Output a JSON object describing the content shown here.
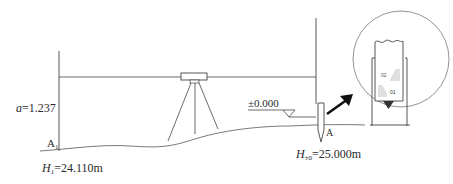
{
  "diagram": {
    "type": "leveling-setup",
    "colors": {
      "line": "#3a3a3a",
      "arrow": "#111111",
      "background": "#ffffff"
    },
    "labels": {
      "backsight_reading_var": "a",
      "backsight_reading_value": "=1.237",
      "point_a1": "A",
      "point_a1_sub": "1",
      "h1_var": "H",
      "h1_sub": "1",
      "h1_value": "=24.110m",
      "datum_mark": "±0.000",
      "point_a": "A",
      "h0_var": "H",
      "h0_sub": "±0",
      "h0_value": "=25.000m"
    },
    "inset": {
      "description": "magnified leveling rod at stake A",
      "rod_marks": [
        "02",
        "01"
      ]
    }
  }
}
